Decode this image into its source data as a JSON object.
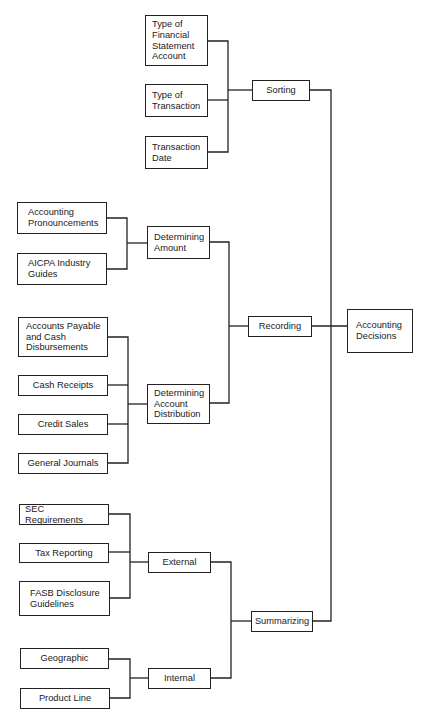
{
  "diagram": {
    "root": "Accounting Decisions",
    "nodes": {
      "accounting_decisions": "Accounting\nDecisions",
      "sorting": "Sorting",
      "recording": "Recording",
      "summarizing": "Summarizing",
      "type_fs_account": "Type of\nFinancial\nStatement\nAccount",
      "type_transaction": "Type of\nTransaction",
      "transaction_date": "Transaction\nDate",
      "determining_amount": "Determining\nAmount",
      "accounting_pronouncements": "Accounting\nPronouncements",
      "aicpa_guides": "AICPA Industry\nGuides",
      "determining_distribution": "Determining\nAccount\nDistribution",
      "accounts_payable": "Accounts Payable\nand Cash\nDisbursements",
      "cash_receipts": "Cash Receipts",
      "credit_sales": "Credit Sales",
      "general_journals": "General Journals",
      "external": "External",
      "sec_requirements": "SEC Requirements",
      "tax_reporting": "Tax Reporting",
      "fasb_guidelines": "FASB Disclosure\nGuidelines",
      "internal": "Internal",
      "geographic": "Geographic",
      "product_line": "Product Line"
    },
    "edges": [
      [
        "sorting",
        "accounting_decisions"
      ],
      [
        "recording",
        "accounting_decisions"
      ],
      [
        "summarizing",
        "accounting_decisions"
      ],
      [
        "type_fs_account",
        "sorting"
      ],
      [
        "type_transaction",
        "sorting"
      ],
      [
        "transaction_date",
        "sorting"
      ],
      [
        "determining_amount",
        "recording"
      ],
      [
        "determining_distribution",
        "recording"
      ],
      [
        "accounting_pronouncements",
        "determining_amount"
      ],
      [
        "aicpa_guides",
        "determining_amount"
      ],
      [
        "accounts_payable",
        "determining_distribution"
      ],
      [
        "cash_receipts",
        "determining_distribution"
      ],
      [
        "credit_sales",
        "determining_distribution"
      ],
      [
        "general_journals",
        "determining_distribution"
      ],
      [
        "external",
        "summarizing"
      ],
      [
        "internal",
        "summarizing"
      ],
      [
        "sec_requirements",
        "external"
      ],
      [
        "tax_reporting",
        "external"
      ],
      [
        "fasb_guidelines",
        "external"
      ],
      [
        "geographic",
        "internal"
      ],
      [
        "product_line",
        "internal"
      ]
    ]
  }
}
